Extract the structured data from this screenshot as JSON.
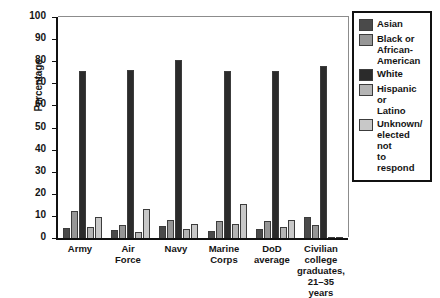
{
  "chart_data": {
    "type": "bar",
    "title": "",
    "xlabel": "",
    "ylabel": "Percentage",
    "ylim": [
      0,
      100
    ],
    "yticks": [
      0,
      10,
      20,
      30,
      40,
      50,
      60,
      70,
      80,
      90,
      100
    ],
    "ytick_labels": [
      "0",
      "10",
      "20",
      "30",
      "40",
      "50",
      "60",
      "70",
      "80",
      "90",
      "100"
    ],
    "grid": false,
    "legend_position": "top-right",
    "categories": [
      "Army",
      "Air\nForce",
      "Navy",
      "Marine\nCorps",
      "DoD\naverage",
      "Civilian\ncollege\ngraduates,\n21–35 years"
    ],
    "series": [
      {
        "name": "Asian",
        "color": "#4a4a4a",
        "values": [
          4.5,
          3.5,
          5.5,
          3.0,
          4.0,
          9.5
        ]
      },
      {
        "name": "Black or\nAfrican-\nAmerican",
        "color": "#969696",
        "values": [
          12.0,
          6.0,
          8.0,
          7.5,
          7.5,
          6.0
        ]
      },
      {
        "name": "White",
        "color": "#2b2b2b",
        "values": [
          75.5,
          76.0,
          80.5,
          75.5,
          75.5,
          78.0
        ]
      },
      {
        "name": "Hispanic or\nLatino",
        "color": "#b4b4b4",
        "values": [
          5.0,
          2.5,
          4.0,
          6.5,
          5.0,
          0.5
        ]
      },
      {
        "name": "Unknown/\nelected not\nto respond",
        "color": "#c8c8c8",
        "values": [
          9.5,
          13.0,
          6.5,
          15.5,
          8.0,
          0.5
        ]
      }
    ]
  }
}
